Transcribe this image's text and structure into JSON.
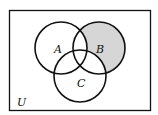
{
  "diagram": {
    "type": "venn",
    "universe_label": "U",
    "sets": [
      {
        "label": "A",
        "cx": 61,
        "cy": 48,
        "r": 26
      },
      {
        "label": "B",
        "cx": 99,
        "cy": 48,
        "r": 26
      },
      {
        "label": "C",
        "cx": 80,
        "cy": 76,
        "r": 26
      }
    ],
    "shaded_region": "B only (B minus A and C)",
    "colors": {
      "shade": "#d6d6d6",
      "stroke": "#111111",
      "background": "#ffffff"
    }
  }
}
